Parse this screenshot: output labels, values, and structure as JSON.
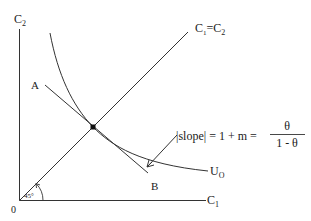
{
  "diagram": {
    "type": "indifference-curve",
    "axes": {
      "y_label": "C",
      "y_sub": "2",
      "x_label": "C",
      "x_sub": "1",
      "origin_label": "0"
    },
    "diagonal": {
      "label_c": "C",
      "label_sub1": "1",
      "label_eq": "=",
      "label_c2": "C",
      "label_sub2": "2",
      "angle_label": "45°"
    },
    "tangent_line": {
      "start_label": "A",
      "end_label": "B"
    },
    "curve": {
      "label": "U",
      "label_sub": "O"
    },
    "annotation": {
      "slope_text": "|slope| = 1 + m =",
      "numerator": "θ",
      "denominator": "1 - θ"
    },
    "colors": {
      "line": "#333333",
      "text": "#1a1a1a",
      "background": "#ffffff"
    }
  }
}
